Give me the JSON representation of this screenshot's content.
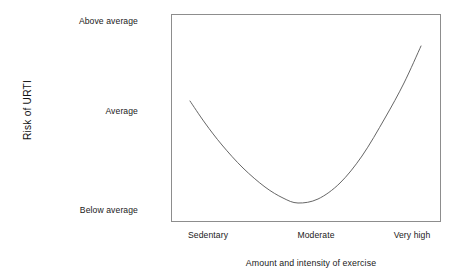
{
  "chart_data": {
    "type": "line",
    "title": "",
    "xlabel": "Amount and intensity of exercise",
    "ylabel": "Risk of URTI",
    "x_tick_labels": [
      "Sedentary",
      "Moderate",
      "Very high"
    ],
    "y_tick_labels": [
      "Below average",
      "Average",
      "Above average"
    ],
    "grid": false,
    "legend": "none",
    "xlim": [
      "Sedentary",
      "Very high"
    ],
    "ylim": [
      "Below average",
      "Above average"
    ],
    "series": [
      {
        "name": "Risk of URTI vs exercise (J-curve)",
        "line_color": "#555555",
        "x": [
          0.07,
          0.15,
          0.25,
          0.35,
          0.46,
          0.55,
          0.63,
          0.72,
          0.8,
          0.88,
          0.93
        ],
        "y": [
          "Average",
          "0.82",
          "0.58",
          "0.38",
          "0.23",
          "0.20",
          "0.29",
          "0.47",
          "0.70",
          "0.95",
          "1.12"
        ],
        "points_px": [
          {
            "x": 190,
            "y": 101
          },
          {
            "x": 205,
            "y": 123
          },
          {
            "x": 222,
            "y": 145
          },
          {
            "x": 243,
            "y": 168
          },
          {
            "x": 265,
            "y": 187
          },
          {
            "x": 283,
            "y": 198
          },
          {
            "x": 298,
            "y": 203
          },
          {
            "x": 318,
            "y": 199
          },
          {
            "x": 340,
            "y": 183
          },
          {
            "x": 362,
            "y": 156
          },
          {
            "x": 385,
            "y": 118
          },
          {
            "x": 404,
            "y": 83
          },
          {
            "x": 421,
            "y": 46
          }
        ],
        "shape": "U-shaped / J-curve: risk is Average for sedentary, drops to Below average at moderate exercise, then rises to Above average at very high exercise"
      }
    ]
  },
  "axes": {
    "y_title": "Risk of URTI",
    "y_ticks": [
      {
        "label": "Above average"
      },
      {
        "label": "Average"
      },
      {
        "label": "Below average"
      }
    ],
    "x_title": "Amount and intensity of exercise",
    "x_ticks": [
      {
        "label": "Sedentary"
      },
      {
        "label": "Moderate"
      },
      {
        "label": "Very high"
      }
    ]
  },
  "colors": {
    "background": "#ffffff",
    "frame": "#8d8d8d",
    "curve": "#555555",
    "text": "#1a1a1a"
  }
}
